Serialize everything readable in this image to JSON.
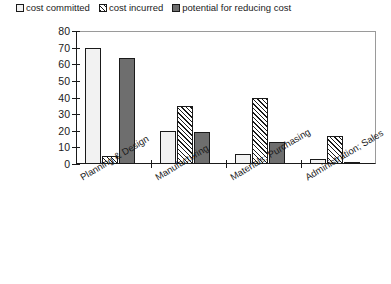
{
  "legend": {
    "items": [
      {
        "label": "cost committed",
        "swatch": "dots-square-icon"
      },
      {
        "label": "cost incurred",
        "swatch": "diagonal-square-icon"
      },
      {
        "label": "potential for reducing cost",
        "swatch": "dark-square-icon"
      }
    ]
  },
  "axes": {
    "ylabel": "Percentage of cost",
    "yticks": [
      "80",
      "70",
      "60",
      "50",
      "40",
      "30",
      "20",
      "10",
      "0"
    ]
  },
  "chart_data": {
    "type": "bar",
    "title": "",
    "xlabel": "",
    "ylabel": "Percentage of cost",
    "ylim": [
      0,
      80
    ],
    "ytick_step": 10,
    "grid": false,
    "legend_position": "top-left",
    "categories": [
      "Planning & Design",
      "Manufacturing",
      "Materials; Purchasing",
      "Administration; Sales"
    ],
    "series": [
      {
        "name": "cost committed",
        "values": [
          70,
          20,
          6,
          3
        ],
        "fill": "dots"
      },
      {
        "name": "cost incurred",
        "values": [
          5,
          35,
          40,
          17
        ],
        "fill": "diagonal"
      },
      {
        "name": "potential for reducing cost",
        "values": [
          64,
          19,
          13,
          1
        ],
        "fill": "dark"
      }
    ]
  }
}
